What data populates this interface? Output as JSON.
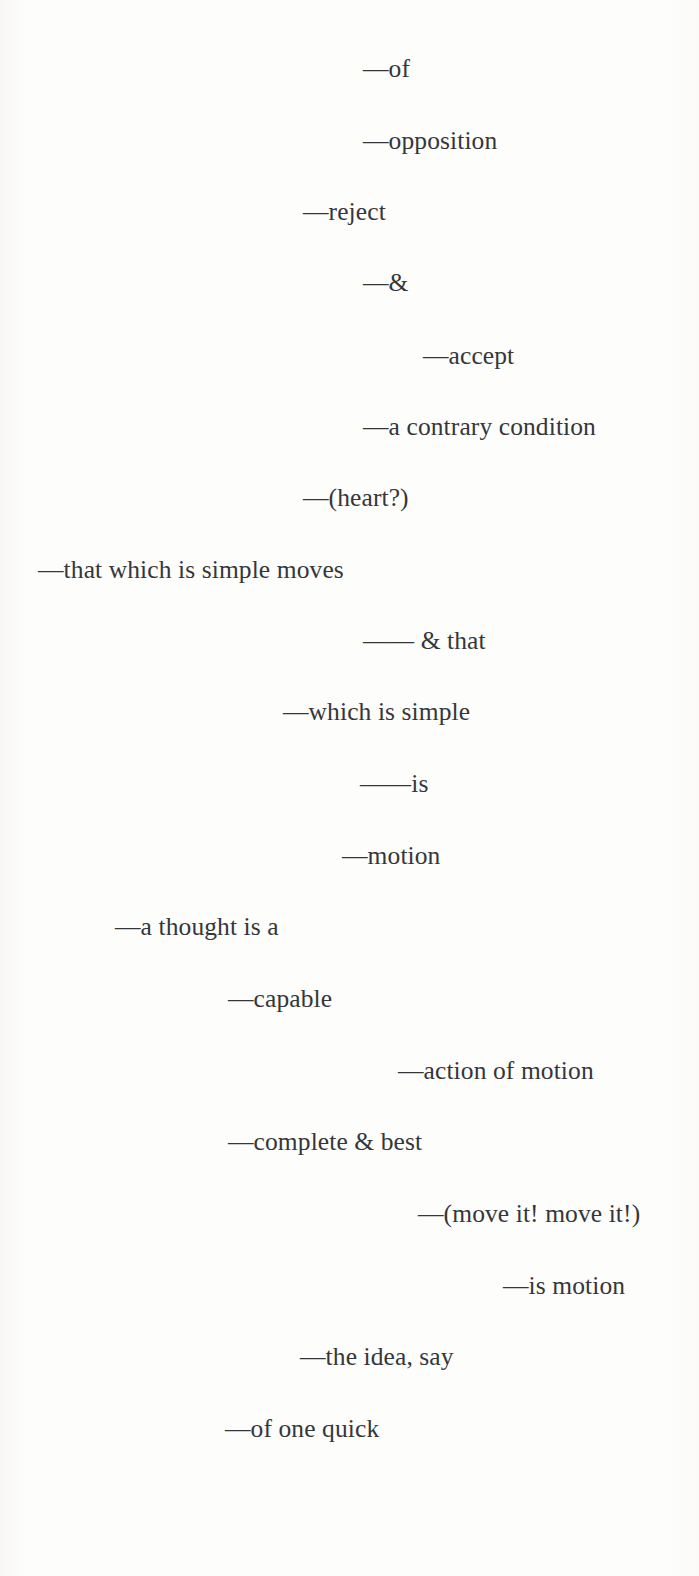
{
  "document": {
    "type": "poem-page",
    "background_color": "#fdfdfc",
    "text_color": "#35363a",
    "alignment": "staggered-indent",
    "page_width": 699,
    "page_height": 1576
  },
  "poem": {
    "lines": [
      {
        "text": "—of",
        "left": 363,
        "top": 56
      },
      {
        "text": "—opposition",
        "left": 363,
        "top": 128
      },
      {
        "text": "—reject",
        "left": 303,
        "top": 199
      },
      {
        "text": "—&",
        "left": 363,
        "top": 270
      },
      {
        "text": "—accept",
        "left": 423,
        "top": 343
      },
      {
        "text": "—a contrary condition",
        "left": 363,
        "top": 414
      },
      {
        "text": "—(heart?)",
        "left": 303,
        "top": 485
      },
      {
        "text": "—that which is simple moves",
        "left": 38,
        "top": 557
      },
      {
        "text": "—— & that",
        "left": 363,
        "top": 628
      },
      {
        "text": "—which is simple",
        "left": 283,
        "top": 699
      },
      {
        "text": "——is",
        "left": 360,
        "top": 771
      },
      {
        "text": "—motion",
        "left": 342,
        "top": 843
      },
      {
        "text": "—a thought is a",
        "left": 115,
        "top": 914
      },
      {
        "text": "—capable",
        "left": 228,
        "top": 986
      },
      {
        "text": "—action of motion",
        "left": 398,
        "top": 1058
      },
      {
        "text": "—complete & best",
        "left": 228,
        "top": 1129
      },
      {
        "text": "—(move it! move it!)",
        "left": 418,
        "top": 1201
      },
      {
        "text": "—is motion",
        "left": 503,
        "top": 1273
      },
      {
        "text": "—the idea, say",
        "left": 300,
        "top": 1344
      },
      {
        "text": "—of one quick",
        "left": 225,
        "top": 1416
      }
    ]
  }
}
